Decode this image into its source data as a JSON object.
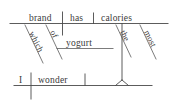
{
  "diagram": {
    "type": "reed-kellogg-sentence-diagram",
    "sentence": "I wonder which brand of yogurt has the most calories.",
    "ink_color": "#4a4a4a",
    "background_color": "#ffffff",
    "clauses": {
      "main": {
        "name": "main-clause",
        "subject": "I",
        "verb": "wonder"
      },
      "subordinate": {
        "name": "subordinate-noun-clause",
        "subject": "brand",
        "verb": "has",
        "object": "calories",
        "modifiers": [
          {
            "word": "which",
            "attaches_to": "brand"
          },
          {
            "word": "of",
            "attaches_to": "brand"
          },
          {
            "word": "yogurt",
            "attaches_to": "of"
          },
          {
            "word": "the",
            "attaches_to": "calories"
          },
          {
            "word": "most",
            "attaches_to": "calories"
          }
        ]
      }
    },
    "words": {
      "brand": "brand",
      "has": "has",
      "calories": "calories",
      "which": "which",
      "of": "of",
      "yogurt": "yogurt",
      "the": "the",
      "most": "most",
      "i": "I",
      "wonder": "wonder"
    }
  }
}
